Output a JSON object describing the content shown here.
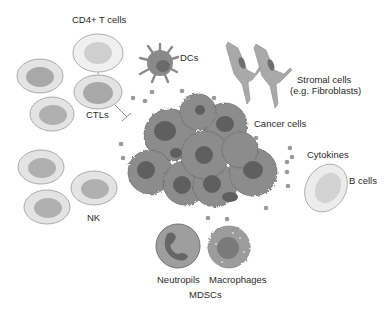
{
  "diagram": {
    "type": "tumor-microenvironment",
    "colors": {
      "background": "#ffffff",
      "lymphocyte_outer": "#e3e3e3",
      "lymphocyte_outer_stroke": "#9a9a9a",
      "lymphocyte_nucleus": "#b3b3b3",
      "cd4_outer": "#f0f0f0",
      "cd4_nucleus": "#cfcfcf",
      "cancer_cell": "#8c8c8c",
      "cancer_cell_stroke": "#6e6e6e",
      "cancer_nucleus": "#5f5f5f",
      "cytokine_dot": "#9a9a9a",
      "dc_body": "#8a8a8a",
      "dc_nucleus": "#6a6a6a",
      "stromal_body": "#a9a9a9",
      "stromal_nucleus": "#6f6f6f",
      "b_cell_outer": "#ececec",
      "b_cell_nucleus": "#d2d2d2",
      "neutrophil_body": "#9e9e9e",
      "neutrophil_nucleus": "#666666",
      "macrophage_body": "#9c9c9c",
      "macrophage_nucleus": "#7a7a7a",
      "text": "#2a2a2a"
    },
    "labels": {
      "cd4_t_cells": "CD4+ T cells",
      "dcs": "DCs",
      "stromal_line1": "Stromal cells",
      "stromal_line2": "(e.g. Fibroblasts)",
      "ctls": "CTLs",
      "cancer_cells": "Cancer cells",
      "cytokines": "Cytokines",
      "nk": "NK",
      "b_cells": "B cells",
      "neutrophils": "Neutropils",
      "macrophages": "Macrophages",
      "mdscs": "MDSCs"
    }
  }
}
